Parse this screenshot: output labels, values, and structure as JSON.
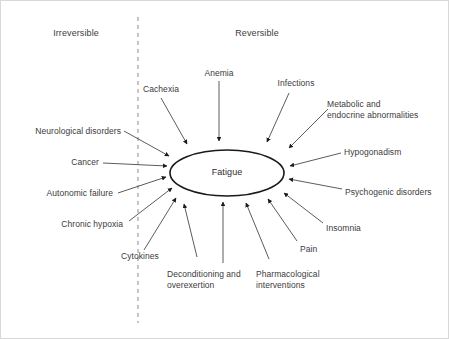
{
  "figure": {
    "background_color": "#ffffff",
    "border_color": "#d8d8d8",
    "line_color": "#4a4a4a",
    "ellipse_stroke_color": "#1a1a1a",
    "text_color": "#3b3b3b",
    "divider": {
      "label_left": "Irreversible",
      "label_right": "Reversible",
      "style": "dashed-vertical"
    },
    "center": {
      "label": "Fatigue",
      "shape": "ellipse"
    },
    "causes": [
      {
        "id": "cachexia",
        "label": "Cachexia",
        "side": "irreversible",
        "align": "center"
      },
      {
        "id": "anemia",
        "label": "Anemia",
        "side": "reversible",
        "align": "center"
      },
      {
        "id": "infections",
        "label": "Infections",
        "side": "reversible",
        "align": "center"
      },
      {
        "id": "metabolic-endocrine",
        "label": "Metabolic and\nendocrine abnormalities",
        "side": "reversible",
        "align": "left"
      },
      {
        "id": "neurological-disorders",
        "label": "Neurological disorders",
        "side": "irreversible",
        "align": "right"
      },
      {
        "id": "hypogonadism",
        "label": "Hypogonadism",
        "side": "reversible",
        "align": "left"
      },
      {
        "id": "cancer",
        "label": "Cancer",
        "side": "irreversible",
        "align": "right"
      },
      {
        "id": "autonomic-failure",
        "label": "Autonomic failure",
        "side": "irreversible",
        "align": "right"
      },
      {
        "id": "psychogenic-disorders",
        "label": "Psychogenic disorders",
        "side": "reversible",
        "align": "left"
      },
      {
        "id": "chronic-hypoxia",
        "label": "Chronic hypoxia",
        "side": "irreversible",
        "align": "right"
      },
      {
        "id": "insomnia",
        "label": "Insomnia",
        "side": "reversible",
        "align": "left"
      },
      {
        "id": "pain",
        "label": "Pain",
        "side": "reversible",
        "align": "left"
      },
      {
        "id": "cytokines",
        "label": "Cytokines",
        "side": "irreversible",
        "align": "center"
      },
      {
        "id": "deconditioning",
        "label": "Deconditioning and\noverexertion",
        "side": "reversible",
        "align": "left"
      },
      {
        "id": "pharmacological",
        "label": "Pharmacological\ninterventions",
        "side": "reversible",
        "align": "left"
      }
    ]
  }
}
